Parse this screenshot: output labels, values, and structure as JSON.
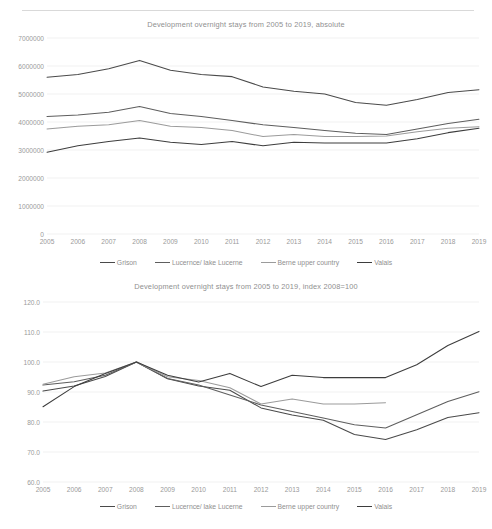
{
  "page_header": {
    "left_text": "",
    "right_text": ""
  },
  "series_colors": {
    "grison": "#4a4a4a",
    "lucerne": "#5e5e5e",
    "berne": "#9b9b9b",
    "valais": "#3d3d3d"
  },
  "legend": {
    "entries": [
      {
        "label": "Grison",
        "color": "#4a4a4a"
      },
      {
        "label": "Lucernce/ lake Lucerne",
        "color": "#5e5e5e"
      },
      {
        "label": "Berne upper country",
        "color": "#9b9b9b"
      },
      {
        "label": "Valais",
        "color": "#3d3d3d"
      }
    ]
  },
  "chart_data": [
    {
      "type": "line",
      "title": "Development overnight stays from 2005 to 2019, absolute",
      "xlabel": "",
      "ylabel": "",
      "grid": true,
      "legend_position": "bottom",
      "categories": [
        "2005",
        "2006",
        "2007",
        "2008",
        "2009",
        "2010",
        "2011",
        "2012",
        "2013",
        "2014",
        "2015",
        "2016",
        "2017",
        "2018",
        "2019"
      ],
      "ylim": [
        0,
        7000000
      ],
      "yticks": [
        0,
        1000000,
        2000000,
        3000000,
        4000000,
        5000000,
        6000000,
        7000000
      ],
      "ytick_labels": [
        "0",
        "1000000",
        "2000000",
        "3000000",
        "4000000",
        "5000000",
        "6000000",
        "7000000"
      ],
      "series": [
        {
          "name": "Grison",
          "values": [
            5600000,
            5700000,
            5900000,
            6200000,
            5850000,
            5700000,
            5620000,
            5250000,
            5100000,
            5000000,
            4700000,
            4600000,
            4800000,
            5050000,
            5150000
          ]
        },
        {
          "name": "Lucernce/ lake Lucerne",
          "values": [
            4200000,
            4250000,
            4350000,
            4550000,
            4300000,
            4200000,
            4050000,
            3900000,
            3800000,
            3700000,
            3600000,
            3550000,
            3750000,
            3950000,
            4100000
          ]
        },
        {
          "name": "Berne upper country",
          "values": [
            3750000,
            3850000,
            3900000,
            4050000,
            3850000,
            3800000,
            3700000,
            3480000,
            3550000,
            3480000,
            3480000,
            3500000,
            3650000,
            3780000,
            3830000
          ]
        },
        {
          "name": "Valais",
          "values": [
            2920000,
            3150000,
            3300000,
            3430000,
            3280000,
            3200000,
            3300000,
            3150000,
            3280000,
            3250000,
            3250000,
            3250000,
            3400000,
            3620000,
            3780000
          ]
        }
      ]
    },
    {
      "type": "line",
      "title": "Development overnight stays from 2005 to 2019, index 2008=100",
      "xlabel": "",
      "ylabel": "",
      "grid": true,
      "legend_position": "bottom",
      "categories": [
        "2005",
        "2006",
        "2007",
        "2008",
        "2009",
        "2010",
        "2011",
        "2012",
        "2013",
        "2014",
        "2015",
        "2016",
        "2017",
        "2018",
        "2019"
      ],
      "ylim": [
        60.0,
        120.0
      ],
      "yticks": [
        60.0,
        70.0,
        80.0,
        90.0,
        100.0,
        110.0,
        120.0
      ],
      "ytick_labels": [
        "60.0",
        "70.0",
        "80.0",
        "90.0",
        "100.0",
        "110.0",
        "120.0"
      ],
      "series": [
        {
          "name": "Grison",
          "values": [
            90.3,
            92.0,
            95.2,
            100.0,
            94.4,
            92.0,
            90.6,
            84.7,
            82.3,
            80.6,
            75.8,
            74.2,
            77.4,
            81.5,
            83.1
          ]
        },
        {
          "name": "Lucernce/ lake Lucerne",
          "values": [
            92.3,
            93.4,
            95.6,
            100.0,
            94.5,
            92.3,
            89.0,
            85.7,
            83.5,
            81.3,
            79.1,
            78.0,
            82.4,
            86.8,
            90.1
          ]
        },
        {
          "name": "Berne upper country",
          "values": [
            92.6,
            95.1,
            96.3,
            100.0,
            95.1,
            93.8,
            91.4,
            86.0,
            87.7,
            86.0,
            86.0,
            86.4,
            null,
            null,
            null
          ]
        },
        {
          "name": "Valais",
          "values": [
            85.1,
            91.8,
            96.2,
            100.0,
            95.6,
            93.3,
            96.2,
            91.8,
            95.6,
            94.8,
            94.8,
            94.8,
            99.1,
            105.5,
            110.2
          ]
        }
      ]
    }
  ]
}
